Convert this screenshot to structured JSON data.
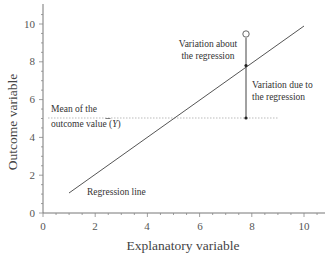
{
  "chart_data": {
    "type": "line",
    "title": "",
    "xlabel": "Explanatory variable",
    "ylabel": "Outcome variable",
    "xlim": [
      0,
      10.8
    ],
    "ylim": [
      0,
      10.8
    ],
    "xticks": [
      0,
      2,
      4,
      6,
      8,
      10
    ],
    "yticks": [
      0,
      2,
      4,
      6,
      8,
      10
    ],
    "x_tick_labels": [
      "0",
      "2",
      "4",
      "6",
      "8",
      "10"
    ],
    "y_tick_labels": [
      "0",
      "2",
      "4",
      "6",
      "8",
      "10"
    ],
    "grid": false,
    "legend": null,
    "series": [
      {
        "name": "Regression line",
        "kind": "line",
        "points": [
          [
            1.0,
            1.0
          ],
          [
            10.0,
            9.9
          ]
        ]
      },
      {
        "name": "Mean of the outcome value (Ȳ)",
        "kind": "dotted-horizontal",
        "y": 5.0,
        "x_range": [
          0.2,
          9.0
        ]
      },
      {
        "name": "Observed point",
        "kind": "open-circle",
        "points": [
          [
            7.8,
            9.4
          ]
        ]
      },
      {
        "name": "Fitted value on regression line",
        "kind": "filled-dot",
        "points": [
          [
            7.8,
            7.75
          ]
        ]
      },
      {
        "name": "Mean value marker",
        "kind": "filled-dot",
        "points": [
          [
            7.8,
            5.0
          ]
        ]
      },
      {
        "name": "Vertical deviation segment",
        "kind": "vertical-line",
        "x": 7.8,
        "y_range": [
          5.0,
          9.4
        ]
      }
    ],
    "annotations": [
      {
        "text": "Variation about\nthe regression",
        "near": [
          6.0,
          8.6
        ]
      },
      {
        "text": "Variation due to\nthe regression",
        "near": [
          8.1,
          6.6
        ]
      },
      {
        "text": "Mean of the\noutcome value (Ȳ)",
        "near": [
          0.3,
          5.3
        ]
      },
      {
        "text": "Regression line",
        "near": [
          2.7,
          0.7
        ]
      }
    ]
  },
  "labels": {
    "xlabel": "Explanatory variable",
    "ylabel": "Outcome variable",
    "x_ticks": [
      "0",
      "2",
      "4",
      "6",
      "8",
      "10"
    ],
    "y_ticks": [
      "0",
      "2",
      "4",
      "6",
      "8",
      "10"
    ],
    "annot_about_1": "Variation about",
    "annot_about_2": "the regression",
    "annot_due_1": "Variation due to",
    "annot_due_2": "the regression",
    "annot_mean_1": "Mean of the",
    "annot_mean_2": "outcome value (",
    "annot_mean_ybar": "Y",
    "annot_mean_close": ")",
    "annot_regline": "Regression line"
  },
  "colors": {
    "axis": "#666666",
    "line": "#555555",
    "dotted": "#aaaaaa",
    "text": "#333333"
  }
}
